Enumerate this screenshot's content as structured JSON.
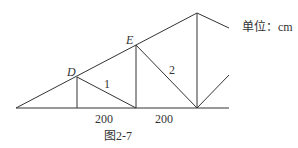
{
  "diagram": {
    "caption": "图2-7",
    "unit_label": "单位：cm",
    "points": {
      "D": "D",
      "E": "E"
    },
    "member_labels": [
      "1",
      "2"
    ],
    "dimensions": [
      "200",
      "200"
    ],
    "line_color": "#333333"
  }
}
